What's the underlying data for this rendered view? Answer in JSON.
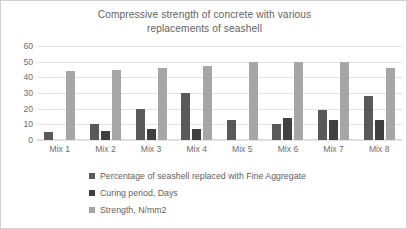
{
  "chart_data": {
    "type": "bar",
    "title": "Compressive strength of concrete with various replacements of seashell",
    "title_line1": "Compressive strength of concrete with various",
    "title_line2": "replacements of seashell",
    "xlabel": "",
    "ylabel": "",
    "ylim": [
      0,
      60
    ],
    "yticks": [
      60,
      50,
      40,
      30,
      20,
      10,
      0
    ],
    "grid": true,
    "legend_position": "bottom-left",
    "categories": [
      "Mix 1",
      "Mix 2",
      "Mix 3",
      "Mix 4",
      "Mix 5",
      "Mix 6",
      "Mix 7",
      "Mix 8"
    ],
    "series": [
      {
        "name": "Percentage of seashell replaced with Fine Aggregate",
        "color": "#595959",
        "values": [
          5,
          10,
          20,
          30,
          13,
          10,
          19,
          28
        ]
      },
      {
        "name": "Curing period, Days",
        "color": "#404040",
        "values": [
          0,
          6,
          7,
          7,
          0,
          14,
          13,
          13
        ]
      },
      {
        "name": "Strength, N/mm2",
        "color": "#a6a6a6",
        "values": [
          44,
          45,
          46,
          47,
          50,
          50,
          50,
          46
        ]
      }
    ]
  },
  "colors": {
    "series_1": "#595959",
    "series_2": "#404040",
    "series_3": "#a6a6a6",
    "gridline": "#e2e2e2",
    "border": "#d0d0d0",
    "text": "#636363",
    "background": "#ffffff"
  }
}
